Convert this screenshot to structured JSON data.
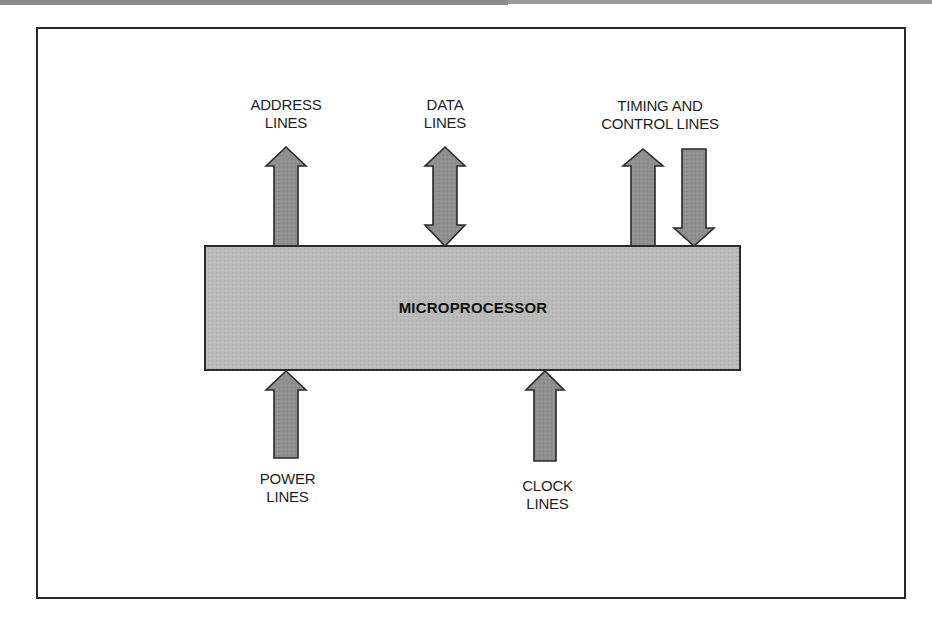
{
  "diagram": {
    "type": "block-diagram",
    "central_block": {
      "label": "MICROPROCESSOR",
      "fill": "#b9b9b9",
      "stroke": "#2a2a2a"
    },
    "arrow_fill": "#8f8f8f",
    "arrow_stroke": "#2a2a2a",
    "signals": [
      {
        "id": "address",
        "label": "ADDRESS\nLINES",
        "position": "top",
        "direction": "out"
      },
      {
        "id": "data",
        "label": "DATA\nLINES",
        "position": "top",
        "direction": "bidirectional"
      },
      {
        "id": "timing-control",
        "label": "TIMING AND\nCONTROL LINES",
        "position": "top",
        "direction": "out-and-in"
      },
      {
        "id": "power",
        "label": "POWER\nLINES",
        "position": "bottom",
        "direction": "in"
      },
      {
        "id": "clock",
        "label": "CLOCK\nLINES",
        "position": "bottom",
        "direction": "in"
      }
    ]
  }
}
